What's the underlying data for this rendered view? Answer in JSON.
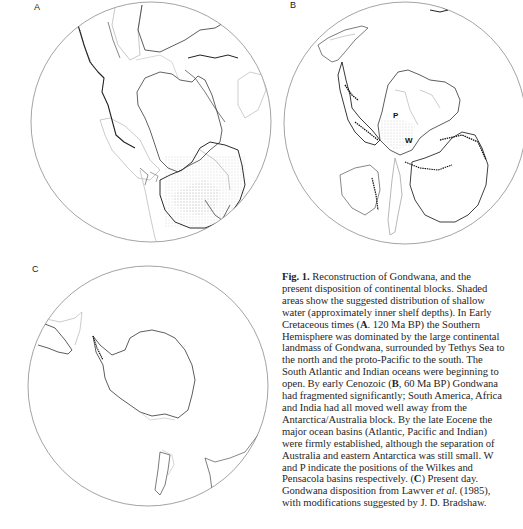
{
  "figure": {
    "panels": [
      {
        "id": "A",
        "label": "A",
        "description": "Early Cretaceous, 120 Ma BP"
      },
      {
        "id": "B",
        "label": "B",
        "description": "Early Cenozoic, 60 Ma BP",
        "markers": [
          {
            "label": "P",
            "meaning": "Pensacola basin"
          },
          {
            "label": "W",
            "meaning": "Wilkes basin"
          }
        ]
      },
      {
        "id": "C",
        "label": "C",
        "description": "Present day"
      }
    ],
    "colors": {
      "coastline": "#2a2a2a",
      "shelf": "#a8a8a8",
      "circle": "#8c8c8c",
      "background": "#ffffff"
    }
  },
  "caption": {
    "lines": [
      {
        "pre": "",
        "bold": "Fig. 1.",
        "post": "  Reconstruction of Gondwana, and the"
      },
      {
        "pre": "present disposition of continental blocks. Shaded",
        "bold": "",
        "post": ""
      },
      {
        "pre": "areas show the suggested distribution of shallow",
        "bold": "",
        "post": ""
      },
      {
        "pre": "water (approximately inner shelf depths). In Early",
        "bold": "",
        "post": ""
      },
      {
        "pre": "Cretaceous times (",
        "bold": "A",
        "post": ". 120 Ma BP) the Southern"
      },
      {
        "pre": "Hemisphere was dominated by the large continental",
        "bold": "",
        "post": ""
      },
      {
        "pre": "landmass of Gondwana, surrounded by Tethys Sea to",
        "bold": "",
        "post": ""
      },
      {
        "pre": "the north and the proto-Pacific to the south. The",
        "bold": "",
        "post": ""
      },
      {
        "pre": "South Atlantic and Indian oceans were beginning to",
        "bold": "",
        "post": ""
      },
      {
        "pre": "open. By early Cenozoic (",
        "bold": "B",
        "post": ", 60 Ma BP) Gondwana"
      },
      {
        "pre": "had fragmented significantly; South America, Africa",
        "bold": "",
        "post": ""
      },
      {
        "pre": "and India had all moved well away from the",
        "bold": "",
        "post": ""
      },
      {
        "pre": "Antarctica/Australia block. By the late Eocene the",
        "bold": "",
        "post": ""
      },
      {
        "pre": "major ocean basins (Atlantic, Pacific and Indian)",
        "bold": "",
        "post": ""
      },
      {
        "pre": "were firmly established, although the separation of",
        "bold": "",
        "post": ""
      },
      {
        "pre": "Australia and eastern Antarctica was still small. W",
        "bold": "",
        "post": ""
      },
      {
        "pre": "and P indicate the positions of the Wilkes and",
        "bold": "",
        "post": ""
      },
      {
        "pre": "Pensacola basins respectively. (",
        "bold": "C",
        "post": ") Present day."
      },
      {
        "pre": "Gondwana disposition from Lawver ",
        "italic": "et al",
        "post": ". (1985),"
      },
      {
        "pre": "with modifications suggested by J. D. Bradshaw.",
        "bold": "",
        "post": ""
      }
    ]
  }
}
